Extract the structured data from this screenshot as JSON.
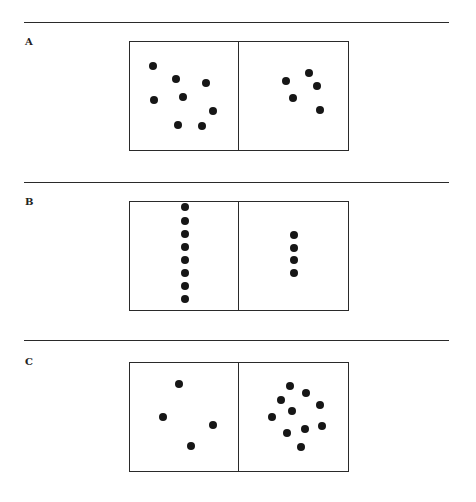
{
  "figure": {
    "panels": [
      {
        "label": "A",
        "rule_y": 22,
        "label_y": 36,
        "box_top": 41,
        "left_count": 8,
        "right_count": 5,
        "left_dots": [
          [
            153,
            66
          ],
          [
            176,
            79
          ],
          [
            206,
            83
          ],
          [
            154,
            100
          ],
          [
            183,
            97
          ],
          [
            213,
            111
          ],
          [
            178,
            125
          ],
          [
            202,
            126
          ]
        ],
        "right_dots": [
          [
            286,
            81
          ],
          [
            309,
            73
          ],
          [
            317,
            86
          ],
          [
            293,
            98
          ],
          [
            320,
            110
          ]
        ]
      },
      {
        "label": "B",
        "rule_y": 182,
        "label_y": 196,
        "box_top": 201,
        "left_count": 8,
        "right_count": 4,
        "left_dots": [
          [
            185,
            207
          ],
          [
            185,
            221
          ],
          [
            185,
            234
          ],
          [
            185,
            247
          ],
          [
            185,
            260
          ],
          [
            185,
            273
          ],
          [
            185,
            286
          ],
          [
            185,
            299
          ]
        ],
        "right_dots": [
          [
            294,
            235
          ],
          [
            294,
            248
          ],
          [
            294,
            260
          ],
          [
            294,
            273
          ]
        ]
      },
      {
        "label": "C",
        "rule_y": 340,
        "label_y": 356,
        "box_top": 362,
        "left_count": 4,
        "right_count": 10,
        "left_dots": [
          [
            179,
            384
          ],
          [
            163,
            417
          ],
          [
            213,
            425
          ],
          [
            191,
            446
          ]
        ],
        "right_dots": [
          [
            290,
            386
          ],
          [
            306,
            393
          ],
          [
            281,
            400
          ],
          [
            320,
            405
          ],
          [
            292,
            411
          ],
          [
            272,
            417
          ],
          [
            322,
            426
          ],
          [
            305,
            429
          ],
          [
            287,
            433
          ],
          [
            301,
            447
          ]
        ]
      }
    ],
    "dot_color": "#161616",
    "line_color": "#2a2a2a"
  }
}
